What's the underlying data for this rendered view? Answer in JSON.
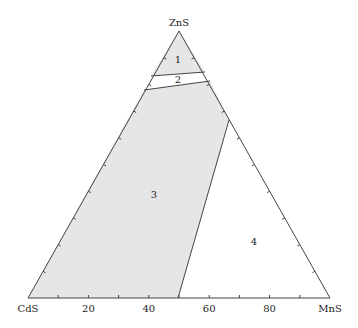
{
  "diagram": {
    "type": "ternary-phase-diagram",
    "vertices": {
      "top": "ZnS",
      "left": "CdS",
      "right": "MnS"
    },
    "base_axis": {
      "tick_labels": [
        "20",
        "40",
        "60",
        "80"
      ]
    },
    "regions": [
      {
        "id": "1",
        "label": "1",
        "filled": true
      },
      {
        "id": "2",
        "label": "2",
        "filled": false
      },
      {
        "id": "3",
        "label": "3",
        "filled": true
      },
      {
        "id": "4",
        "label": "4",
        "filled": false
      }
    ],
    "colors": {
      "fill": "#e6e6e6",
      "line": "#444444",
      "background": "#ffffff"
    }
  }
}
